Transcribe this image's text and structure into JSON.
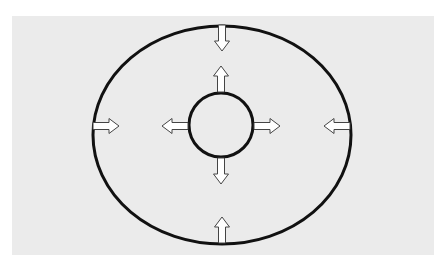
{
  "diagram": {
    "colors": {
      "background": "#ebebeb",
      "stroke": "#111111",
      "arrow_fill": "#ffffff",
      "arrow_stroke": "#444444"
    },
    "outer_ellipse": {
      "cx": 222,
      "cy": 135,
      "rx": 129,
      "ry": 109,
      "arrows_direction": "inward",
      "arrow_count": 4
    },
    "inner_circle": {
      "cx": 221,
      "cy": 125,
      "r": 32,
      "arrows_direction": "outward",
      "arrow_count": 4
    }
  }
}
